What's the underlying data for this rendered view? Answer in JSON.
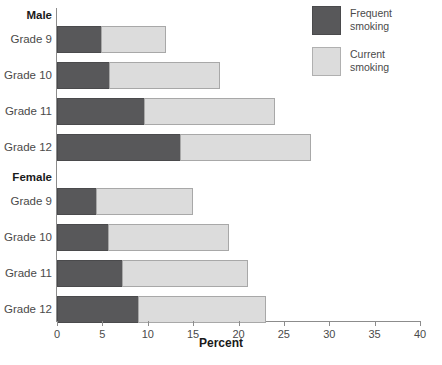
{
  "legend": {
    "items": [
      {
        "key": "frequent",
        "line1": "Frequent",
        "line2": "smoking",
        "color": "#58585a"
      },
      {
        "key": "current",
        "line1": "Current",
        "line2": "smoking",
        "color": "#dcdcdc"
      }
    ]
  },
  "axis": {
    "x_title": "Percent",
    "ticks": [
      "0",
      "5",
      "10",
      "15",
      "20",
      "25",
      "30",
      "35",
      "40"
    ]
  },
  "groups": [
    {
      "label": "Male"
    },
    {
      "label": "Female"
    }
  ],
  "note": "",
  "chart_data": {
    "type": "bar",
    "orientation": "horizontal",
    "stacked": true,
    "title": "",
    "xlabel": "Percent",
    "ylabel": "",
    "xlim": [
      0,
      40
    ],
    "xticks": [
      0,
      5,
      10,
      15,
      20,
      25,
      30,
      35,
      40
    ],
    "grid": false,
    "legend_position": "top-right",
    "categories": [
      "Male Grade 9",
      "Male Grade 10",
      "Male Grade 11",
      "Male Grade 12",
      "Female Grade 9",
      "Female Grade 10",
      "Female Grade 11",
      "Female Grade 12"
    ],
    "group_headers": [
      "Male",
      "Female"
    ],
    "series": [
      {
        "name": "Frequent smoking",
        "color": "#58585a",
        "values": [
          4.8,
          5.7,
          9.6,
          13.6,
          4.3,
          5.6,
          7.2,
          8.9
        ]
      },
      {
        "name": "Current smoking",
        "color": "#dcdcdc",
        "values": [
          12.0,
          18.0,
          24.0,
          28.0,
          15.0,
          19.0,
          21.0,
          23.0
        ]
      }
    ],
    "bars": [
      {
        "group": "Male",
        "category": "Grade 9",
        "frequent": 4.8,
        "current_total": 12.0
      },
      {
        "group": "Male",
        "category": "Grade 10",
        "frequent": 5.7,
        "current_total": 18.0
      },
      {
        "group": "Male",
        "category": "Grade 11",
        "frequent": 9.6,
        "current_total": 24.0
      },
      {
        "group": "Male",
        "category": "Grade 12",
        "frequent": 13.6,
        "current_total": 28.0
      },
      {
        "group": "Female",
        "category": "Grade 9",
        "frequent": 4.3,
        "current_total": 15.0
      },
      {
        "group": "Female",
        "category": "Grade 10",
        "frequent": 5.6,
        "current_total": 19.0
      },
      {
        "group": "Female",
        "category": "Grade 11",
        "frequent": 7.2,
        "current_total": 21.0
      },
      {
        "group": "Female",
        "category": "Grade 12",
        "frequent": 8.9,
        "current_total": 23.0
      }
    ]
  }
}
